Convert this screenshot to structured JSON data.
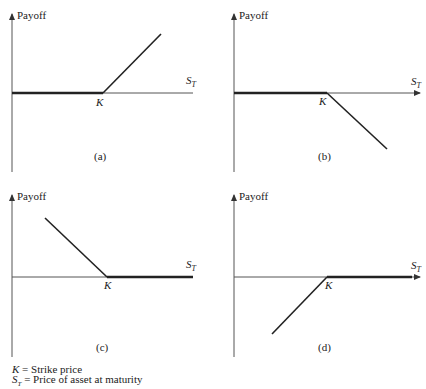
{
  "diagram": {
    "y_axis_label": "Payoff",
    "x_axis_label": "S",
    "x_axis_subscript": "T",
    "strike_label": "K",
    "panels": [
      {
        "id": "a",
        "caption": "(a)",
        "shape": "flat then rising after K",
        "position": "long call"
      },
      {
        "id": "b",
        "caption": "(b)",
        "shape": "flat then falling after K",
        "position": "short call"
      },
      {
        "id": "c",
        "caption": "(c)",
        "shape": "falling to K then flat",
        "position": "long put"
      },
      {
        "id": "d",
        "caption": "(d)",
        "shape": "rising to K then flat",
        "position": "short put"
      }
    ]
  },
  "legend": {
    "line1_symbol": "K",
    "line1_text": " = Strike price",
    "line2_symbol": "S",
    "line2_subscript": "T",
    "line2_text": " = Price of asset at maturity"
  }
}
